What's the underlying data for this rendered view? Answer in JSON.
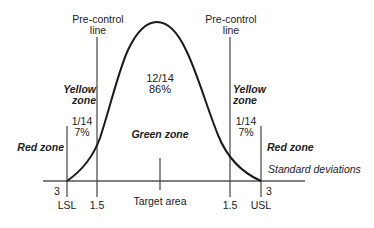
{
  "diagram": {
    "precontrol_left": {
      "line1": "Pre-control",
      "line2": "line"
    },
    "precontrol_right": {
      "line1": "Pre-control",
      "line2": "line"
    },
    "center": {
      "fraction": "12/14",
      "percent": "86%"
    },
    "left_tail": {
      "fraction": "1/14",
      "percent": "7%"
    },
    "right_tail": {
      "fraction": "1/14",
      "percent": "7%"
    },
    "yellow_left": {
      "line1": "Yellow",
      "line2": "zone"
    },
    "yellow_right": {
      "line1": "Yellow",
      "line2": "zone"
    },
    "green_zone": "Green zone",
    "red_left": "Red zone",
    "red_right": "Red zone",
    "axis_label": "Standard deviations",
    "ticks": {
      "lsl_sigma": "3",
      "usl_sigma": "3",
      "lsl": "LSL",
      "usl": "USL",
      "pc_left": "1.5",
      "pc_right": "1.5",
      "target": "Target area"
    },
    "colors": {
      "line": "#1a1a1a",
      "axis": "#555555",
      "background": "#ffffff"
    }
  }
}
